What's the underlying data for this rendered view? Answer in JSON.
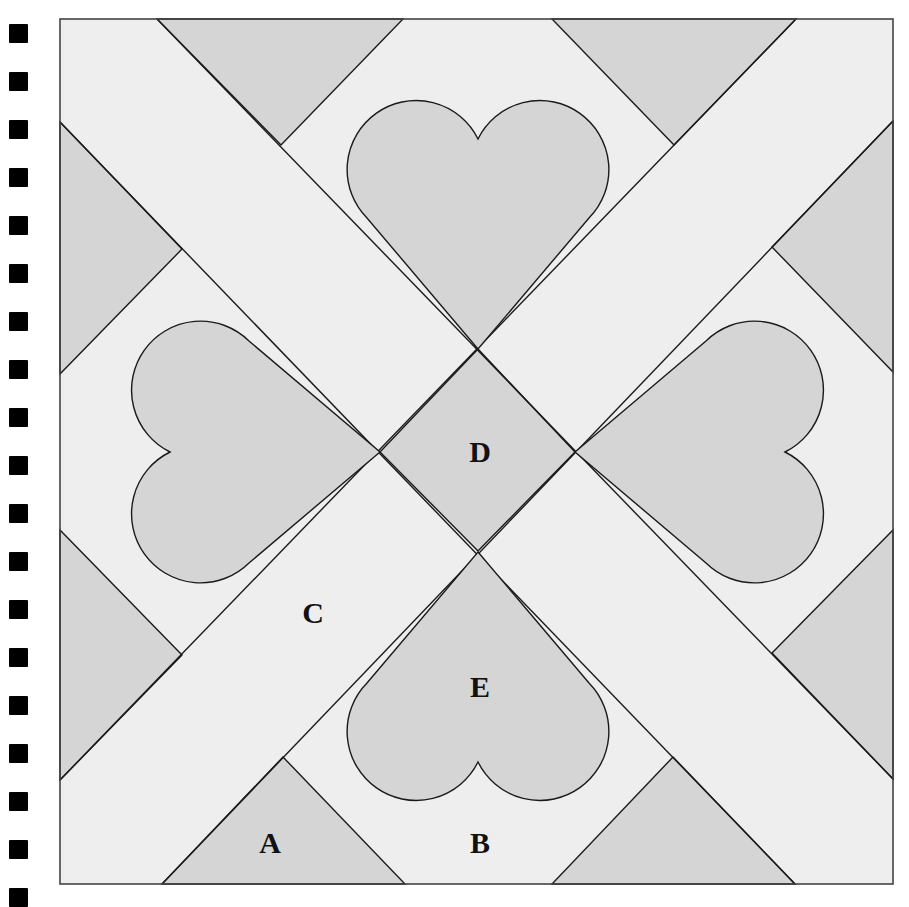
{
  "diagram": {
    "type": "quilt-block",
    "frame": {
      "x": 60,
      "y": 19,
      "width": 833,
      "height": 865
    },
    "colors": {
      "light": "#eeeeee",
      "dark": "#d5d5d5",
      "line": "#1a1a1a",
      "frame": "#444444",
      "marks": "#000000"
    },
    "labels": [
      {
        "id": "A",
        "text": "A",
        "x": 270,
        "y": 853
      },
      {
        "id": "B",
        "text": "B",
        "x": 480,
        "y": 853
      },
      {
        "id": "C",
        "text": "C",
        "x": 313,
        "y": 623
      },
      {
        "id": "D",
        "text": "D",
        "x": 480,
        "y": 462
      },
      {
        "id": "E",
        "text": "E",
        "x": 480,
        "y": 697
      }
    ],
    "regions": {
      "center_diamond": "478,349 575,452 478,551 380,452",
      "triangles": [
        {
          "name": "top-left",
          "points": "157,19 403,19 281,145"
        },
        {
          "name": "top-right",
          "points": "552,19 796,19 674,145"
        },
        {
          "name": "left-upper",
          "points": "60,122 60,374 182,249"
        },
        {
          "name": "left-lower",
          "points": "60,530 60,780 182,655"
        },
        {
          "name": "right-upper",
          "points": "893,121 893,372 772,247"
        },
        {
          "name": "right-lower",
          "points": "893,530 893,779 772,653"
        },
        {
          "name": "bottom-left",
          "points": "162,884 405,884 283,757"
        },
        {
          "name": "bottom-right",
          "points": "552,884 795,884 673,757"
        }
      ],
      "hearts": [
        {
          "name": "top",
          "transform": "translate(478,349)"
        },
        {
          "name": "bottom",
          "transform": "translate(478,552) rotate(180)"
        },
        {
          "name": "left",
          "transform": "translate(380,452) rotate(-90)"
        },
        {
          "name": "right",
          "transform": "translate(575,452) rotate(90)"
        }
      ],
      "heart_path": "M0 0 L-111 -131 A69 69 0 1 1 0 -210 A69 69 0 1 1 111 -131 Z",
      "band_lines": [
        "157,19 893,779",
        "60,122 795,884",
        "796,19 60,780",
        "893,121 162,884"
      ]
    },
    "registration_marks": {
      "count": 19,
      "x": 9,
      "start_y": 24,
      "spacing": 48,
      "size": 19
    }
  }
}
